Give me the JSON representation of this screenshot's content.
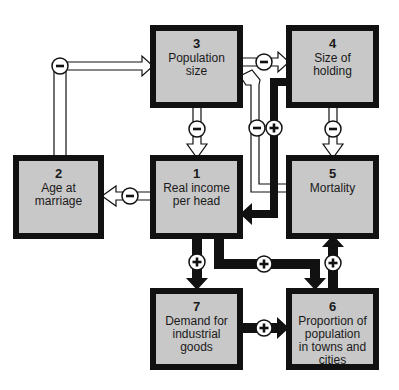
{
  "diagram": {
    "nodes": [
      {
        "id": "1",
        "number": "1",
        "label": "Real income\nper head"
      },
      {
        "id": "2",
        "number": "2",
        "label": "Age at\nmarriage"
      },
      {
        "id": "3",
        "number": "3",
        "label": "Population\nsize"
      },
      {
        "id": "4",
        "number": "4",
        "label": "Size of\nholding"
      },
      {
        "id": "5",
        "number": "5",
        "label": "Mortality"
      },
      {
        "id": "6",
        "number": "6",
        "label": "Proportion of\npopulation\nin towns and\ncities"
      },
      {
        "id": "7",
        "number": "7",
        "label": "Demand for\nindustrial\ngoods"
      }
    ],
    "edges": [
      {
        "from": "2",
        "to": "3",
        "sign": "−",
        "style": "hollow"
      },
      {
        "from": "3",
        "to": "4",
        "sign": "−",
        "style": "hollow"
      },
      {
        "from": "3",
        "to": "1",
        "sign": "−",
        "style": "hollow"
      },
      {
        "from": "5",
        "to": "3",
        "sign": "−",
        "style": "hollow"
      },
      {
        "from": "4",
        "to": "1",
        "sign": "+",
        "style": "solid"
      },
      {
        "from": "4",
        "to": "5",
        "sign": "−",
        "style": "hollow"
      },
      {
        "from": "1",
        "to": "2",
        "sign": "−",
        "style": "hollow"
      },
      {
        "from": "1",
        "to": "7",
        "sign": "+",
        "style": "solid"
      },
      {
        "from": "1",
        "to": "6",
        "sign": "+",
        "style": "solid"
      },
      {
        "from": "7",
        "to": "6",
        "sign": "+",
        "style": "solid"
      },
      {
        "from": "6",
        "to": "5",
        "sign": "+",
        "style": "solid"
      }
    ],
    "colors": {
      "box_fill": "#c8c8c8",
      "box_border": "#111111",
      "arrow_solid": "#111111",
      "arrow_hollow_fill": "#ffffff"
    }
  }
}
